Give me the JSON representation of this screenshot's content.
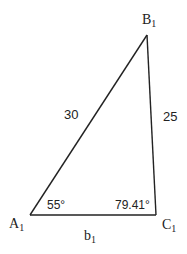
{
  "diagram": {
    "type": "triangle",
    "vertices": {
      "A": {
        "label": "A",
        "subscript": "1"
      },
      "B": {
        "label": "B",
        "subscript": "1"
      },
      "C": {
        "label": "C",
        "subscript": "1"
      }
    },
    "sides": {
      "AB": "30",
      "BC": "25",
      "AC": {
        "label": "b",
        "subscript": "1"
      }
    },
    "angles": {
      "A": "55°",
      "C": "79.41°"
    },
    "line_color": "#222222"
  }
}
